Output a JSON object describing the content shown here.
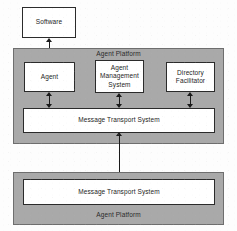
{
  "diagram": {
    "colors": {
      "platform_fill": "#a9a9a9",
      "box_fill": "#ffffff",
      "stroke": "#2b2b2b",
      "background": "#fdfdfd"
    },
    "external": {
      "software": {
        "label": "Software"
      }
    },
    "platform_top": {
      "label": "Agent Platform",
      "label_position": "top-center",
      "components": [
        {
          "id": "agent",
          "label": "Agent"
        },
        {
          "id": "agent-management-system",
          "label": "Agent\nManagement\nSystem"
        },
        {
          "id": "directory-facilitator",
          "label": "Directory\nFacilitator"
        },
        {
          "id": "message-transport-system",
          "label": "Message Transport System"
        }
      ]
    },
    "platform_bottom": {
      "label": "Agent Platform",
      "label_position": "bottom-center",
      "components": [
        {
          "id": "message-transport-system",
          "label": "Message Transport System"
        }
      ]
    },
    "connections": [
      {
        "id": "software-agent",
        "from": "software",
        "to": "agent",
        "style": "double-arrow"
      },
      {
        "id": "agent-mts",
        "from": "agent",
        "to": "message-transport-system",
        "style": "double-arrow"
      },
      {
        "id": "ams-mts",
        "from": "agent-management-system",
        "to": "message-transport-system",
        "style": "double-arrow"
      },
      {
        "id": "df-mts",
        "from": "directory-facilitator",
        "to": "message-transport-system",
        "style": "double-arrow"
      },
      {
        "id": "mts-mts",
        "from": "message-transport-system-top",
        "to": "message-transport-system-bottom",
        "style": "double-arrow"
      }
    ]
  }
}
